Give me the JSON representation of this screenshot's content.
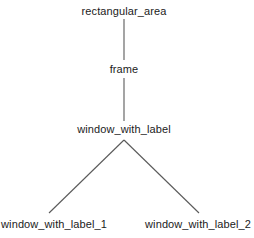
{
  "diagram": {
    "type": "tree",
    "background_color": "#ffffff",
    "edge_color": "#5a5a5a",
    "text_color": "#1b1b1b",
    "nodes": [
      {
        "id": "root",
        "label": "rectangular_area",
        "x": 124,
        "y": 11
      },
      {
        "id": "n1",
        "label": "frame",
        "x": 124,
        "y": 69
      },
      {
        "id": "n2",
        "label": "window_with_label",
        "x": 124,
        "y": 129
      },
      {
        "id": "n3",
        "label": "window_with_label_1",
        "x": 54,
        "y": 224
      },
      {
        "id": "n4",
        "label": "window_with_label_2",
        "x": 198,
        "y": 224
      }
    ],
    "edges": [
      {
        "from": "root",
        "to": "n1",
        "x1": 124,
        "y1": 19,
        "x2": 124,
        "y2": 60
      },
      {
        "from": "n1",
        "to": "n2",
        "x1": 124,
        "y1": 78,
        "x2": 124,
        "y2": 121
      },
      {
        "from": "n2",
        "to": "n3",
        "x1": 124,
        "y1": 140,
        "x2": 49,
        "y2": 213
      },
      {
        "from": "n2",
        "to": "n4",
        "x1": 124,
        "y1": 140,
        "x2": 199,
        "y2": 213
      }
    ]
  }
}
